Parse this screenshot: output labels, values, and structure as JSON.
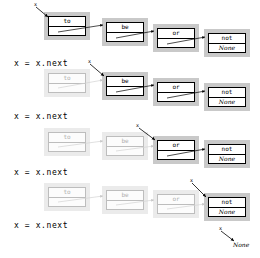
{
  "figure": {
    "caption": "",
    "values": {
      "node1": "to",
      "node2": "be",
      "node3": "or",
      "node4": "not",
      "node4_next": "None",
      "pointer_var": "x",
      "null_value": "None"
    },
    "colors": {
      "ink": "#000000",
      "shadow": "#d9d9d9",
      "dim_ink": "#b0b0b0",
      "dim_border": "#bdbdbd",
      "paper": "#ffffff"
    },
    "code_lines": [
      "x = x.next",
      "x = x.next",
      "x = x.next",
      "x = x.next"
    ],
    "states": [
      {
        "step": 1,
        "pointer_target": "to",
        "nodes": [
          {
            "value": "to",
            "next": "be",
            "state": "current"
          },
          {
            "value": "be",
            "next": "or",
            "state": "active"
          },
          {
            "value": "or",
            "next": "not",
            "state": "active"
          },
          {
            "value": "not",
            "next": "None",
            "state": "active"
          }
        ]
      },
      {
        "step": 2,
        "pointer_target": "be",
        "nodes": [
          {
            "value": "to",
            "next": "be",
            "state": "dim"
          },
          {
            "value": "be",
            "next": "or",
            "state": "current"
          },
          {
            "value": "or",
            "next": "not",
            "state": "active"
          },
          {
            "value": "not",
            "next": "None",
            "state": "active"
          }
        ]
      },
      {
        "step": 3,
        "pointer_target": "or",
        "nodes": [
          {
            "value": "to",
            "next": "be",
            "state": "dim"
          },
          {
            "value": "be",
            "next": "or",
            "state": "dim"
          },
          {
            "value": "or",
            "next": "not",
            "state": "current"
          },
          {
            "value": "not",
            "next": "None",
            "state": "active"
          }
        ]
      },
      {
        "step": 4,
        "pointer_target": "not",
        "nodes": [
          {
            "value": "to",
            "next": "be",
            "state": "dim"
          },
          {
            "value": "be",
            "next": "or",
            "state": "dim"
          },
          {
            "value": "or",
            "next": "not",
            "state": "dim"
          },
          {
            "value": "not",
            "next": "None",
            "state": "current"
          }
        ]
      },
      {
        "step": 5,
        "pointer_target": "None",
        "nodes": []
      }
    ]
  }
}
